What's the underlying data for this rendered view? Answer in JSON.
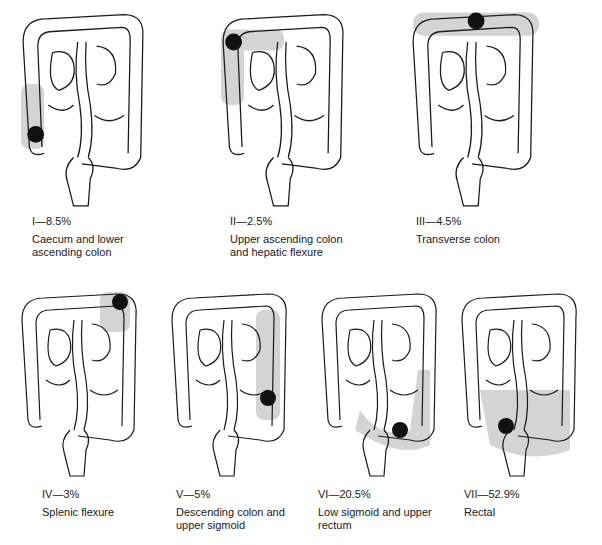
{
  "figure": {
    "panels": [
      {
        "id": "I",
        "label": "I—8.5%",
        "percent": 8.5,
        "site": "Caecum and lower ascending colon"
      },
      {
        "id": "II",
        "label": "II—2.5%",
        "percent": 2.5,
        "site": "Upper ascending colon and hepatic flexure"
      },
      {
        "id": "III",
        "label": "III—4.5%",
        "percent": 4.5,
        "site": "Transverse colon"
      },
      {
        "id": "IV",
        "label": "IV—3%",
        "percent": 3,
        "site": "Splenic flexure"
      },
      {
        "id": "V",
        "label": "V—5%",
        "percent": 5,
        "site": "Descending colon and upper sigmoid"
      },
      {
        "id": "VI",
        "label": "VI—20.5%",
        "percent": 20.5,
        "site": "Low sigmoid and upper rectum"
      },
      {
        "id": "VII",
        "label": "VII—52.9%",
        "percent": 52.9,
        "site": "Rectal"
      }
    ]
  },
  "colors": {
    "outline": "#1a1a1a",
    "shade": "#d4d4d4",
    "tumour": "#111111"
  }
}
